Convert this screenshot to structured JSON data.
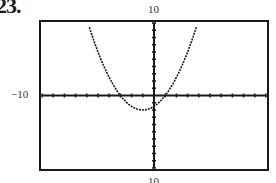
{
  "problem": {
    "number": "23."
  },
  "window_labels": {
    "ymax": "10",
    "xmin": "−10",
    "ymin": "10"
  },
  "chart_data": {
    "type": "line",
    "title": "",
    "xlabel": "",
    "ylabel": "",
    "xlim": [
      -10,
      10
    ],
    "ylim": [
      -10,
      10
    ],
    "grid": false,
    "legend": null,
    "tick_spacing": {
      "x": 1,
      "y": 1
    },
    "series": [
      {
        "name": "parabola",
        "description": "Upward-opening parabola crossing x-axis near x=-3 and x=1, vertex near (-1,-2)",
        "x": [
          -5.9,
          -5,
          -4,
          -3,
          -2,
          -1,
          0,
          1,
          2,
          3,
          3.9
        ],
        "values": [
          10,
          6,
          2.5,
          0,
          -1.5,
          -2,
          -1.5,
          0,
          2.5,
          6,
          10
        ]
      }
    ],
    "annotations": [
      "10 (top)",
      "−10 (left)",
      "10 (bottom, partially cropped)"
    ]
  },
  "colors": {
    "frame": "#1a1a1a",
    "curve": "#1a1a1a",
    "background": "#ffffff"
  }
}
